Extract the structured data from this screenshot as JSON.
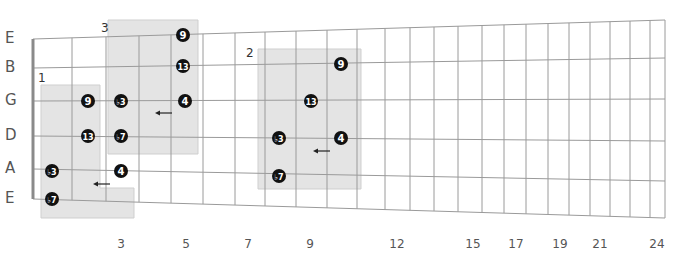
{
  "strings": [
    {
      "name": "E",
      "y_nut": 39,
      "y_end": 20
    },
    {
      "name": "B",
      "y_nut": 68,
      "y_end": 58
    },
    {
      "name": "G",
      "y_nut": 101,
      "y_end": 99
    },
    {
      "name": "D",
      "y_nut": 136,
      "y_end": 141
    },
    {
      "name": "A",
      "y_nut": 169,
      "y_end": 181
    },
    {
      "name": "E",
      "y_nut": 199,
      "y_end": 218
    }
  ],
  "nut_x": 33,
  "end_x": 665,
  "frets_x": [
    72,
    106,
    139,
    171,
    203,
    235,
    265,
    296,
    327,
    357,
    385,
    410,
    434,
    458,
    482,
    504,
    526,
    548,
    569,
    590,
    610,
    630,
    650,
    665
  ],
  "fret_numbers": [
    {
      "label": "3",
      "x": 121
    },
    {
      "label": "5",
      "x": 186
    },
    {
      "label": "7",
      "x": 248
    },
    {
      "label": "9",
      "x": 310
    },
    {
      "label": "12",
      "x": 397
    },
    {
      "label": "15",
      "x": 473
    },
    {
      "label": "17",
      "x": 516
    },
    {
      "label": "19",
      "x": 560
    },
    {
      "label": "21",
      "x": 600
    },
    {
      "label": "24",
      "x": 657
    }
  ],
  "boxes": [
    {
      "label": "1",
      "label_x": 38,
      "label_y": 72,
      "points": "41,85 100,85 100,188 134,188 134,218 41,218"
    },
    {
      "label": "3",
      "label_x": 101,
      "label_y": 22,
      "points": "108,20 198,20 198,154 108,154"
    },
    {
      "label": "2",
      "label_x": 246,
      "label_y": 47,
      "points": "258,49 361,49 361,189 258,189"
    }
  ],
  "dots": [
    {
      "label": "9",
      "x": 88,
      "y": 101
    },
    {
      "label": "13",
      "x": 88,
      "y": 136
    },
    {
      "label": "♭3",
      "x": 52,
      "y": 171
    },
    {
      "label": "♭7",
      "x": 52,
      "y": 199
    },
    {
      "label": "4",
      "x": 121,
      "y": 171
    },
    {
      "label": "♭3",
      "x": 121,
      "y": 101
    },
    {
      "label": "♭7",
      "x": 121,
      "y": 136
    },
    {
      "label": "9",
      "x": 183,
      "y": 35
    },
    {
      "label": "13",
      "x": 183,
      "y": 66
    },
    {
      "label": "4",
      "x": 185,
      "y": 101
    },
    {
      "label": "9",
      "x": 341,
      "y": 64
    },
    {
      "label": "13",
      "x": 311,
      "y": 101
    },
    {
      "label": "♭3",
      "x": 279,
      "y": 138
    },
    {
      "label": "4",
      "x": 341,
      "y": 138
    },
    {
      "label": "♭7",
      "x": 279,
      "y": 176
    }
  ],
  "arrows": [
    {
      "x1": 110,
      "x2": 93,
      "y": 184
    },
    {
      "x1": 172,
      "x2": 155,
      "y": 113
    },
    {
      "x1": 330,
      "x2": 313,
      "y": 151
    }
  ],
  "colors": {
    "line": "#9a9a9a",
    "nut": "#8a8a8a",
    "box_fill": "#e4e4e4",
    "box_stroke": "#cfcfcf",
    "dot": "#111111",
    "dot_text": "#ffffff"
  }
}
